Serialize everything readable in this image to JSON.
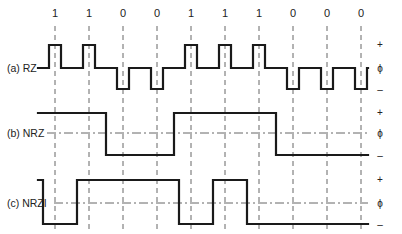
{
  "diagram": {
    "bits": [
      "1",
      "1",
      "0",
      "0",
      "1",
      "1",
      "1",
      "0",
      "0",
      "0"
    ],
    "bit_x": [
      55,
      89,
      123,
      157,
      191,
      225,
      259,
      293,
      327,
      361
    ],
    "bit_width": 34,
    "start_x": 38,
    "end_x": 368,
    "rows": [
      {
        "id": "rz",
        "label": "(a) RZ",
        "label_x": 7,
        "label_y": 72,
        "levels": {
          "plus": 45,
          "zero": 68,
          "minus": 89
        },
        "level_labels": {
          "plus": "+",
          "zero": "ϕ",
          "minus": "–"
        },
        "color": "#1a1a1a"
      },
      {
        "id": "nrz",
        "label": "(b) NRZ",
        "label_x": 7,
        "label_y": 137,
        "levels": {
          "plus": 113,
          "zero": 133,
          "minus": 155
        },
        "level_labels": {
          "plus": "+",
          "zero": "ϕ",
          "minus": "–"
        },
        "color": "#1a1a1a"
      },
      {
        "id": "nrzi",
        "label": "(c) NRZI",
        "label_x": 7,
        "label_y": 207,
        "levels": {
          "plus": 180,
          "zero": 203,
          "minus": 224
        },
        "level_labels": {
          "plus": "+",
          "zero": "ϕ",
          "minus": "–"
        },
        "color": "#1a1a1a"
      }
    ],
    "guide_top": 12,
    "guide_bottom": 232
  }
}
